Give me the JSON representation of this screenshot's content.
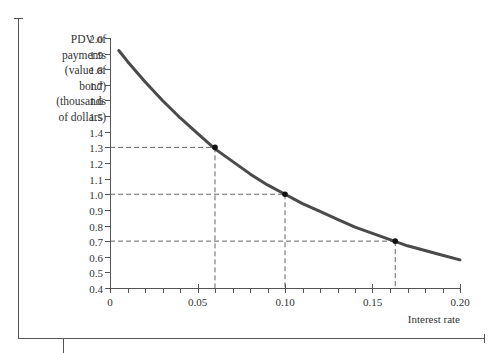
{
  "chart_data": {
    "type": "line",
    "title": "",
    "xlabel": "Interest rate",
    "ylabel_lines": [
      "PDV of",
      "payments",
      "(value of",
      "bond)",
      "(thousands",
      "of dollars)"
    ],
    "xlim": [
      0,
      0.2
    ],
    "ylim": [
      0.4,
      2.0
    ],
    "x_ticks": [
      0,
      0.05,
      0.1,
      0.15,
      0.2
    ],
    "x_tick_labels": [
      "0",
      "0.05",
      "0.10",
      "0.15",
      "0.20"
    ],
    "x_minor_step": 0.01,
    "y_ticks": [
      0.4,
      0.5,
      0.6,
      0.7,
      0.8,
      0.9,
      1.0,
      1.1,
      1.2,
      1.3,
      1.4,
      1.5,
      1.6,
      1.7,
      1.8,
      1.9,
      2.0
    ],
    "y_tick_labels": [
      "0.4",
      "0.5",
      "0.6",
      "0.7",
      "0.8",
      "0.9",
      "1.0",
      "1.1",
      "1.2",
      "1.3",
      "1.4",
      "1.5",
      "1.6",
      "1.7",
      "1.8",
      "1.9",
      "2.0"
    ],
    "grid": false,
    "legend": null,
    "series": [
      {
        "name": "PDV of bond payments",
        "color": "#4a4a4a",
        "x": [
          0.005,
          0.01,
          0.02,
          0.03,
          0.04,
          0.05,
          0.06,
          0.07,
          0.08,
          0.09,
          0.1,
          0.11,
          0.12,
          0.13,
          0.14,
          0.15,
          0.16,
          0.17,
          0.18,
          0.19,
          0.2
        ],
        "y": [
          1.92,
          1.85,
          1.72,
          1.6,
          1.49,
          1.39,
          1.29,
          1.21,
          1.13,
          1.06,
          1.0,
          0.94,
          0.89,
          0.84,
          0.79,
          0.75,
          0.71,
          0.67,
          0.64,
          0.61,
          0.58
        ]
      }
    ],
    "highlighted_points": [
      {
        "x": 0.06,
        "y": 1.3
      },
      {
        "x": 0.1,
        "y": 1.0
      },
      {
        "x": 0.163,
        "y": 0.7
      }
    ],
    "annotations": "Dashed guide lines from each highlighted point to both axes"
  }
}
